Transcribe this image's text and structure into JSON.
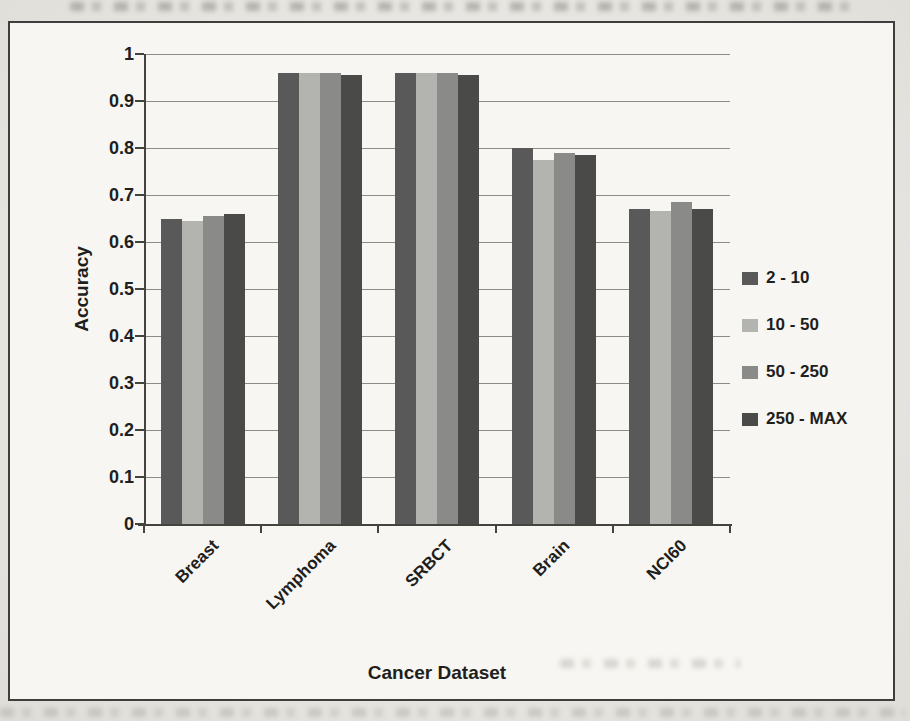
{
  "chart_data": {
    "type": "bar",
    "title": "",
    "xlabel": "Cancer Dataset",
    "ylabel": "Accuracy",
    "categories": [
      "Breast",
      "Lymphoma",
      "SRBCT",
      "Brain",
      "NCI60"
    ],
    "series": [
      {
        "name": "2 - 10",
        "color": "#595959",
        "values": [
          0.65,
          0.96,
          0.96,
          0.8,
          0.67
        ]
      },
      {
        "name": "10 - 50",
        "color": "#b3b3af",
        "values": [
          0.645,
          0.96,
          0.96,
          0.775,
          0.665
        ]
      },
      {
        "name": "50 - 250",
        "color": "#8a8a88",
        "values": [
          0.655,
          0.96,
          0.96,
          0.79,
          0.685
        ]
      },
      {
        "name": "250 - MAX",
        "color": "#4a4a48",
        "values": [
          0.66,
          0.955,
          0.955,
          0.785,
          0.67
        ]
      }
    ],
    "ylim": [
      0,
      1
    ],
    "ytick_values": [
      1,
      0.9,
      0.8,
      0.7,
      0.6,
      0.5,
      0.4,
      0.3,
      0.2,
      0.1,
      0
    ],
    "ytick_labels": [
      "1",
      "0.9",
      "0.8",
      "0.7",
      "0.6",
      "0.5",
      "0.4",
      "0.3",
      "0.2",
      "0.1",
      "0"
    ],
    "grid": true,
    "legend_position": "right"
  },
  "colors": {
    "page_bg": "#ebe9e4",
    "plot_bg": "#f7f6f2",
    "frame_border": "#3e3e3c",
    "grid": "#8b8b87",
    "axis": "#44443f",
    "text": "#1e1e1c"
  }
}
